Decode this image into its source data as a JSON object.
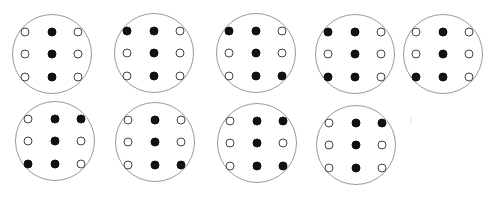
{
  "figure": {
    "colors": {
      "filled": "#111111",
      "empty_stroke": "#444444",
      "circle_stroke": "#9a9a9a",
      "background": "#ffffff"
    },
    "panels": [
      {
        "id": 1,
        "cx": 52,
        "cy": 54,
        "r": 40,
        "grid": [
          [
            0,
            1,
            0
          ],
          [
            0,
            1,
            0
          ],
          [
            0,
            1,
            0
          ]
        ]
      },
      {
        "id": 2,
        "cx": 154,
        "cy": 53,
        "r": 40,
        "grid": [
          [
            1,
            1,
            0
          ],
          [
            0,
            1,
            0
          ],
          [
            0,
            1,
            0
          ]
        ]
      },
      {
        "id": 3,
        "cx": 256,
        "cy": 53,
        "r": 40,
        "grid": [
          [
            1,
            1,
            0
          ],
          [
            0,
            1,
            0
          ],
          [
            0,
            1,
            1
          ]
        ]
      },
      {
        "id": 4,
        "cx": 355,
        "cy": 54,
        "r": 40,
        "grid": [
          [
            1,
            1,
            0
          ],
          [
            0,
            1,
            0
          ],
          [
            1,
            1,
            0
          ]
        ]
      },
      {
        "id": 5,
        "cx": 443,
        "cy": 54,
        "r": 40,
        "grid": [
          [
            0,
            1,
            0
          ],
          [
            0,
            1,
            0
          ],
          [
            1,
            1,
            0
          ]
        ]
      },
      {
        "id": 6,
        "cx": 55,
        "cy": 141,
        "r": 40,
        "grid": [
          [
            0,
            1,
            1
          ],
          [
            0,
            1,
            0
          ],
          [
            1,
            1,
            0
          ]
        ]
      },
      {
        "id": 7,
        "cx": 155,
        "cy": 142,
        "r": 40,
        "grid": [
          [
            0,
            1,
            0
          ],
          [
            0,
            1,
            0
          ],
          [
            0,
            1,
            1
          ]
        ]
      },
      {
        "id": 8,
        "cx": 257,
        "cy": 143,
        "r": 40,
        "grid": [
          [
            0,
            1,
            1
          ],
          [
            0,
            1,
            0
          ],
          [
            0,
            1,
            1
          ]
        ]
      },
      {
        "id": 9,
        "cx": 356,
        "cy": 145,
        "r": 40,
        "grid": [
          [
            0,
            1,
            1
          ],
          [
            0,
            1,
            0
          ],
          [
            0,
            1,
            0
          ]
        ]
      }
    ],
    "dot_offsets": {
      "dx": [
        -27,
        0,
        26
      ],
      "dy": [
        -22,
        0,
        23
      ]
    }
  }
}
